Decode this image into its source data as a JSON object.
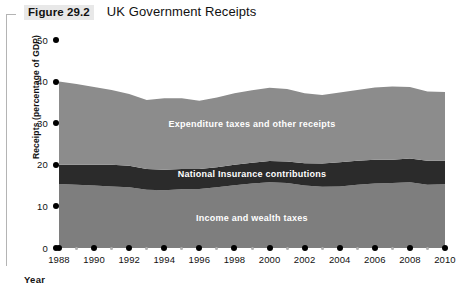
{
  "figure": {
    "number": "Figure 29.2",
    "title": "UK Government Receipts"
  },
  "axes": {
    "y_label": "Receipts (percentage of GDP)",
    "x_label": "Year",
    "y_ticks": [
      "0",
      "10",
      "20",
      "30",
      "40",
      "50"
    ],
    "x_ticks": [
      "1988",
      "1990",
      "1992",
      "1994",
      "1996",
      "1998",
      "2000",
      "2002",
      "2004",
      "2006",
      "2008",
      "2010"
    ]
  },
  "series_labels": {
    "top": "Expenditure taxes and other receipts",
    "middle": "National Insurance contributions",
    "bottom": "Income and wealth taxes"
  },
  "colors": {
    "top_band": "#8c8c8c",
    "middle_band": "#2b2b2b",
    "bottom_band": "#7e7e7e",
    "axis": "#000000",
    "minor_tick": "#b0b0b0",
    "label_text": "#ffffff",
    "figure_number_bg": "#e8e8e8"
  },
  "chart_data": {
    "type": "area",
    "title": "UK Government Receipts",
    "xlabel": "Year",
    "ylabel": "Receipts (percentage of GDP)",
    "xlim": [
      1988,
      2010
    ],
    "ylim": [
      0,
      50
    ],
    "grid": false,
    "legend": "inline-labels",
    "stacked": true,
    "x": [
      1988,
      1989,
      1990,
      1991,
      1992,
      1993,
      1994,
      1995,
      1996,
      1997,
      1998,
      1999,
      2000,
      2001,
      2002,
      2003,
      2004,
      2005,
      2006,
      2007,
      2008,
      2009,
      2010
    ],
    "series": [
      {
        "name": "Income and wealth taxes",
        "color": "#7e7e7e",
        "values": [
          15.4,
          15.2,
          15.0,
          14.8,
          14.6,
          14.0,
          13.9,
          14.1,
          14.2,
          14.6,
          15.1,
          15.5,
          15.8,
          15.6,
          15.0,
          14.7,
          14.8,
          15.2,
          15.5,
          15.6,
          15.8,
          15.2,
          15.3
        ]
      },
      {
        "name": "National Insurance contributions",
        "color": "#2b2b2b",
        "values": [
          4.6,
          4.8,
          5.0,
          5.2,
          5.2,
          5.0,
          4.9,
          4.9,
          4.8,
          4.8,
          4.9,
          5.0,
          5.1,
          5.2,
          5.4,
          5.6,
          5.8,
          5.8,
          5.7,
          5.6,
          5.7,
          5.8,
          5.7
        ]
      },
      {
        "name": "Expenditure taxes and other receipts",
        "color": "#8c8c8c",
        "values": [
          20.0,
          19.4,
          18.7,
          18.0,
          17.2,
          16.6,
          17.2,
          17.0,
          16.4,
          16.8,
          17.2,
          17.4,
          17.6,
          17.4,
          16.8,
          16.5,
          16.8,
          17.0,
          17.4,
          17.6,
          17.2,
          16.6,
          16.5
        ]
      }
    ],
    "totals": [
      40.0,
      39.4,
      38.7,
      38.0,
      37.0,
      35.6,
      36.0,
      36.0,
      35.4,
      36.2,
      37.2,
      37.9,
      38.5,
      38.2,
      37.2,
      36.8,
      37.4,
      38.0,
      38.6,
      38.8,
      38.7,
      37.6,
      37.5
    ]
  }
}
